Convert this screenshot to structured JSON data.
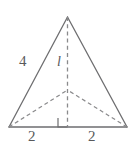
{
  "figure": {
    "type": "geometry-diagram",
    "shape": "triangular-pyramid-net",
    "canvas": {
      "width": 135,
      "height": 146,
      "background": "#ffffff"
    },
    "colors": {
      "stroke_solid": "#6e6e70",
      "stroke_dashed": "#8a8a8c",
      "label_text": "#59595b",
      "background": "#ffffff"
    },
    "geometry": {
      "apex": {
        "x": 67.5,
        "y": 17
      },
      "base_left": {
        "x": 9,
        "y": 127
      },
      "base_right": {
        "x": 127,
        "y": 127
      },
      "base_midpoint": {
        "x": 67.5,
        "y": 127
      },
      "interior_point": {
        "x": 67.5,
        "y": 90
      },
      "right_angle_marker": {
        "x": 58,
        "y": 118,
        "size": 9
      }
    },
    "labels": {
      "slant_side": "4",
      "altitude": "l",
      "base_left_segment": "2",
      "base_right_segment": "2"
    }
  }
}
